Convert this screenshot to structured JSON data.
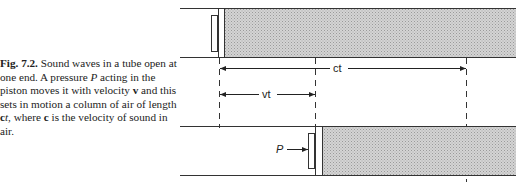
{
  "caption": {
    "label": "Fig. 7.2.",
    "text_part1": " Sound waves in a tube open at one end. A pressure ",
    "symbol_P": "P",
    "text_part2": " acting in the piston moves it with velocity ",
    "symbol_v": "v",
    "text_part3": " and this sets in motion a column of air of length ",
    "symbol_c": "c",
    "symbol_t": "t",
    "text_part4": ", where ",
    "symbol_c2": "c",
    "text_part5": " is the velocity of sound in air."
  },
  "diagram": {
    "top_tube": {
      "state": "initial",
      "piston_position": "left end"
    },
    "bottom_tube": {
      "state": "after time t",
      "piston_force_label": "P"
    },
    "dimensions": {
      "ct_label": "ct",
      "vt_label": "vt"
    },
    "colors": {
      "line": "#333333",
      "shading": "#c8c8c8"
    }
  }
}
